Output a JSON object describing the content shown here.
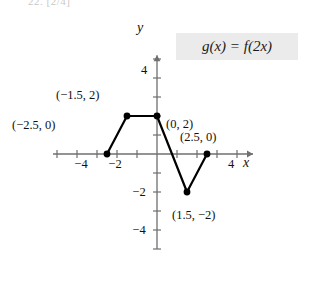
{
  "figure": {
    "cut_text": "22. [2/4]",
    "legend": {
      "text": "g(x) = f(2x)",
      "background": "#ebebeb"
    },
    "axes": {
      "x_name": "x",
      "y_name": "y",
      "x_tick_labels": [
        {
          "text": "−4",
          "value": -4
        },
        {
          "text": "−2",
          "value": -2
        },
        {
          "text": "4",
          "value": 4
        }
      ],
      "y_tick_labels": [
        {
          "text": "4",
          "value": 4
        },
        {
          "text": "−2",
          "value": -2
        },
        {
          "text": "−4",
          "value": -4
        }
      ],
      "xlim": [
        -5.2,
        4.8
      ],
      "ylim": [
        -5.0,
        5.2
      ],
      "origin_px": [
        157,
        154
      ],
      "unit_px_x": 20,
      "unit_px_y": 19
    },
    "point_labels": [
      {
        "text": "(−2.5, 0)",
        "x": 12,
        "y": 118
      },
      {
        "text": "(−1.5, 2)",
        "x": 56,
        "y": 88
      },
      {
        "text": "(0, 2)",
        "x": 166,
        "y": 117
      },
      {
        "text": "(2.5, 0)",
        "x": 180,
        "y": 130
      },
      {
        "text": "(1.5, −2)",
        "x": 172,
        "y": 208
      }
    ]
  },
  "chart_data": {
    "type": "line",
    "title": "",
    "xlabel": "x",
    "ylabel": "y",
    "xlim": [
      -5.2,
      4.8
    ],
    "ylim": [
      -5.0,
      5.2
    ],
    "grid": false,
    "legend": "g(x) = f(2x)",
    "legend_position": "top-right",
    "x_ticks": [
      -4,
      -2,
      4
    ],
    "y_ticks": [
      4,
      -2,
      -4
    ],
    "series": [
      {
        "name": "g(x) = f(2x)",
        "marker": "filled-circle",
        "color": "#000000",
        "points": [
          {
            "x": -2.5,
            "y": 0
          },
          {
            "x": -1.5,
            "y": 2
          },
          {
            "x": 0,
            "y": 2
          },
          {
            "x": 1.5,
            "y": -2
          },
          {
            "x": 2.5,
            "y": 0
          }
        ]
      }
    ],
    "annotations": [
      "(−2.5, 0)",
      "(−1.5, 2)",
      "(0, 2)",
      "(2.5, 0)",
      "(1.5, −2)"
    ]
  }
}
